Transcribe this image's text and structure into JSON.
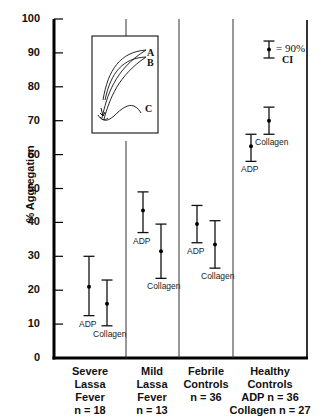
{
  "chart_data": {
    "type": "scatter",
    "subtype": "point-with-error-bars",
    "title": "",
    "xlabel": "",
    "ylabel": "% Aggregation",
    "ylim": [
      0,
      100
    ],
    "yticks": [
      0,
      10,
      20,
      30,
      40,
      50,
      60,
      70,
      80,
      90,
      100
    ],
    "grid": false,
    "categories": [
      {
        "lines": [
          "Severe",
          "Lassa",
          "Fever",
          "n = 18"
        ]
      },
      {
        "lines": [
          "Mild",
          "Lassa",
          "Fever",
          "n = 13"
        ]
      },
      {
        "lines": [
          "Febrile",
          "Controls",
          "n = 36"
        ]
      },
      {
        "lines": [
          "Healthy",
          "Controls",
          "ADP n = 36",
          "Collagen n = 27"
        ]
      }
    ],
    "series": [
      {
        "name": "ADP",
        "points": [
          {
            "category": "Severe Lassa Fever",
            "mean": 21,
            "ci_low": 12.5,
            "ci_high": 30
          },
          {
            "category": "Mild Lassa Fever",
            "mean": 43.5,
            "ci_low": 37,
            "ci_high": 49
          },
          {
            "category": "Febrile Controls",
            "mean": 39.5,
            "ci_low": 34,
            "ci_high": 45
          },
          {
            "category": "Healthy Controls",
            "mean": 62.5,
            "ci_low": 58,
            "ci_high": 66
          }
        ]
      },
      {
        "name": "Collagen",
        "points": [
          {
            "category": "Severe Lassa Fever",
            "mean": 16,
            "ci_low": 9.5,
            "ci_high": 23
          },
          {
            "category": "Mild Lassa Fever",
            "mean": 31.5,
            "ci_low": 23.5,
            "ci_high": 39.5
          },
          {
            "category": "Febrile Controls",
            "mean": 33.5,
            "ci_low": 26.5,
            "ci_high": 40.5
          },
          {
            "category": "Healthy Controls",
            "mean": 70,
            "ci_low": 66,
            "ci_high": 74
          }
        ]
      }
    ],
    "legend": {
      "symbol": "point-with-error-bar",
      "text_line1": "= 90%",
      "text_line2": "CI",
      "position": "upper-right"
    },
    "inset": {
      "description": "aggregation tracing curves",
      "curves": [
        "A",
        "B",
        "C"
      ]
    }
  },
  "labels": {
    "ylabel": "% Aggregation",
    "adp": "ADP",
    "collagen": "Collagen",
    "legend_line1": "= 90%",
    "legend_line2": "CI",
    "inset_a": "A",
    "inset_b": "B",
    "inset_c": "C"
  }
}
